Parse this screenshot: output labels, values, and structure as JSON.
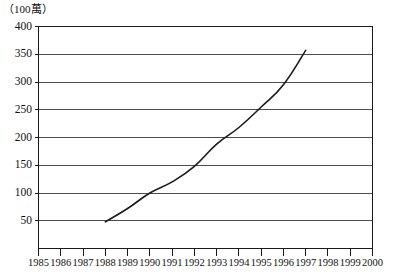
{
  "chart_data": {
    "type": "line",
    "title": "",
    "subtitle": "",
    "unit_label": "（100萬）",
    "xlabel": "",
    "ylabel": "",
    "xlim": [
      1985,
      2000
    ],
    "ylim": [
      0,
      400
    ],
    "grid": true,
    "legend": false,
    "legend_position": "none",
    "y_ticks": [
      400,
      350,
      300,
      250,
      200,
      150,
      100,
      50
    ],
    "y_tick_labels": [
      "400",
      "350",
      "300",
      "250",
      "200",
      "150",
      "100",
      "50"
    ],
    "x_ticks": [
      1985,
      1986,
      1987,
      1988,
      1989,
      1990,
      1991,
      1992,
      1993,
      1994,
      1995,
      1996,
      1997,
      1998,
      1999,
      2000
    ],
    "x_tick_labels": [
      "1985",
      "1986",
      "1987",
      "1988",
      "1989",
      "1990",
      "1991",
      "1992",
      "1993",
      "1994",
      "1995",
      "1996",
      "1997",
      "1998",
      "1999",
      "2000"
    ],
    "series": [
      {
        "name": "series-1",
        "color": "#1a1a1a",
        "line_width": 1.6,
        "x": [
          1988,
          1989,
          1990,
          1991,
          1992,
          1993,
          1994,
          1995,
          1996,
          1997
        ],
        "values": [
          48,
          72,
          100,
          120,
          148,
          188,
          218,
          255,
          295,
          357
        ]
      }
    ],
    "annotations": []
  },
  "colors": {
    "axis": "#1a1a1a",
    "grid": "#4d4d4d",
    "line": "#1a1a1a",
    "background": "#ffffff",
    "text": "#111111"
  }
}
